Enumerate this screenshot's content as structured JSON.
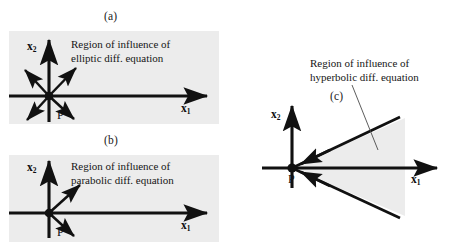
{
  "figure": {
    "panels": [
      {
        "letter": "(a)",
        "equation_type": "elliptic",
        "region_text_line1": "Region of influence of",
        "region_text_line2": "elliptic diff. equation",
        "x1_label": "x",
        "x1_sub": "1",
        "x2_label": "x",
        "x2_sub": "2",
        "point_label": "P",
        "arrow_directions": [
          "up",
          "right",
          "up-left",
          "up-right",
          "down-left",
          "down-right",
          "down"
        ],
        "background_color": "#ececec"
      },
      {
        "letter": "(b)",
        "equation_type": "parabolic",
        "region_text_line1": "Region of influence of",
        "region_text_line2": "parabolic diff. equation",
        "x1_label": "x",
        "x1_sub": "1",
        "x2_label": "x",
        "x2_sub": "2",
        "point_label": "P",
        "arrow_directions": [
          "up",
          "right",
          "up-right",
          "down-right"
        ],
        "background_color": "#ececec"
      },
      {
        "letter": "(c)",
        "equation_type": "hyperbolic",
        "region_text_line1": "Region of influence of",
        "region_text_line2": "hyperbolic diff. equation",
        "x1_label": "x",
        "x1_sub": "1",
        "x2_label": "x",
        "x2_sub": "2",
        "point_label": "P",
        "arrow_directions": [
          "up",
          "right",
          "cone-upper-inward",
          "cone-lower-inward"
        ],
        "cone_fill_color": "#ececec"
      }
    ],
    "stroke_color": "#111111"
  }
}
